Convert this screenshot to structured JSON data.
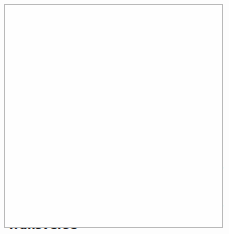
{
  "figure": {
    "background_color": "#fdfdfd",
    "frame_color": "#b9b9b9",
    "label_color": "#17171a",
    "leader_line_color": "#1a1a1a"
  },
  "labels": [
    {
      "id": "facet-joint",
      "line1": "Facet",
      "line2": "Joint",
      "align": "right"
    },
    {
      "id": "body",
      "line1": "Body",
      "line2": "",
      "align": "right"
    },
    {
      "id": "pedicle",
      "line1": "Pedicle",
      "line2": "",
      "align": "left"
    },
    {
      "id": "spinal-canal",
      "line1": "Spinal",
      "line2": "Canal",
      "align": "left"
    },
    {
      "id": "spinous-process",
      "line1": "Spinous",
      "line2": "Process",
      "align": "right"
    },
    {
      "id": "lamina",
      "line1": "Lamina",
      "line2": "",
      "align": "left"
    },
    {
      "id": "transverse-process",
      "line1": "Transverse",
      "line2": "Process",
      "align": "left"
    }
  ]
}
